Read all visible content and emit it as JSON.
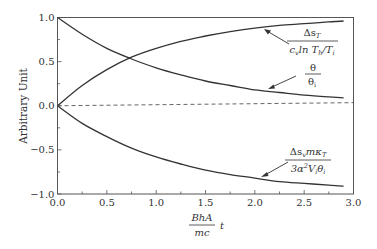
{
  "chart_data": {
    "type": "line",
    "title": "",
    "xlabel": "BhA/mc t",
    "xlabel_parts": {
      "numerator": "BhA",
      "denominator": "mc",
      "suffix": "t"
    },
    "ylabel": "Arbitrary Unit",
    "xlim": [
      0.0,
      3.0
    ],
    "ylim": [
      -1.0,
      1.0
    ],
    "x_ticks": [
      "0.0",
      "0.5",
      "1.0",
      "1.5",
      "2.0",
      "2.5",
      "3.0"
    ],
    "y_ticks": [
      "1.0",
      "0.5",
      "0.0",
      "-0.5",
      "-1.0"
    ],
    "grid": false,
    "legend": "inline annotations with arrows",
    "x": [
      0.0,
      0.25,
      0.5,
      0.75,
      1.0,
      1.25,
      1.5,
      1.75,
      2.0,
      2.25,
      2.5,
      2.75,
      2.9
    ],
    "series": [
      {
        "name": "Δs_T / (c_v ln T_h/T_i)",
        "annotation": {
          "numerator": "Δs",
          "num_sub": "T",
          "denominator": "c",
          "den_sub": "v",
          "den_rest": "ln T",
          "den_sub2": "h",
          "den_tail": "/T",
          "den_sub3": "i"
        },
        "values": [
          0.0,
          0.23,
          0.41,
          0.55,
          0.65,
          0.73,
          0.79,
          0.84,
          0.88,
          0.91,
          0.93,
          0.95,
          0.96
        ]
      },
      {
        "name": "θ / θ_i",
        "annotation": {
          "numerator": "θ",
          "denominator": "θ",
          "den_sub": "i"
        },
        "values": [
          1.0,
          0.81,
          0.65,
          0.53,
          0.43,
          0.35,
          0.28,
          0.23,
          0.18,
          0.15,
          0.12,
          0.1,
          0.09
        ]
      },
      {
        "name": "Δs_v m κ_T / (3α² V_i θ_i)",
        "annotation": {
          "numerator": "Δs",
          "num_sub": "v",
          "num_rest": "mκ",
          "num_sub2": "T",
          "denominator": "3α",
          "den_sup": "2",
          "den_rest": "V",
          "den_sub": "i",
          "den_tail": "θ",
          "den_sub2": "i"
        },
        "values": [
          0.0,
          -0.2,
          -0.35,
          -0.48,
          -0.58,
          -0.66,
          -0.73,
          -0.78,
          -0.82,
          -0.86,
          -0.88,
          -0.9,
          -0.91
        ]
      },
      {
        "name": "zero reference (dashed)",
        "values": [
          0.0,
          0.0,
          0.0,
          0.0,
          0.01,
          0.01,
          0.01,
          0.02,
          0.02,
          0.02,
          0.03,
          0.03,
          0.03
        ]
      }
    ]
  }
}
